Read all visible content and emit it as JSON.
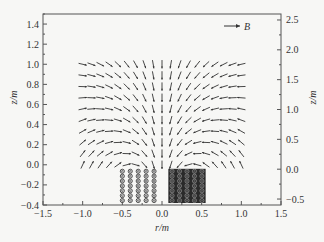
{
  "chart_data": {
    "type": "quiver",
    "title": "",
    "xlabel": "r/m",
    "ylabel_left": "z/m",
    "ylabel_right": "z/m",
    "xlim": [
      -1.5,
      1.5
    ],
    "ylim_left": [
      -0.4,
      1.5
    ],
    "ylim_right": [
      -0.6,
      2.6
    ],
    "x_ticks": [
      "-1.5",
      "-1.0",
      "-0.5",
      "0.0",
      "0.5",
      "1.0",
      "1.5"
    ],
    "y_ticks_left": [
      "-0.4",
      "-0.2",
      "0.0",
      "0.2",
      "0.4",
      "0.6",
      "0.8",
      "1.0",
      "1.2",
      "1.4"
    ],
    "y_ticks_right": [
      "-0.5",
      "0.0",
      "0.5",
      "1.0",
      "1.5",
      "2.0",
      "2.5"
    ],
    "legend": {
      "label": "B",
      "symbol": "arrow"
    },
    "grid": false,
    "field_grid": {
      "r_range": [
        -1.0,
        1.0
      ],
      "z_range": [
        0.0,
        1.0
      ],
      "columns": 19,
      "rows": 10,
      "description": "Magnetic field vectors above coil; vectors point up/inward near axis, fanning outward to the right and down at edges"
    },
    "coils": [
      {
        "name": "left-coil",
        "r_range": [
          -0.55,
          -0.05
        ],
        "z_range": [
          -0.38,
          -0.04
        ],
        "columns": 5,
        "rows": 7,
        "symbol": "dot (current out of page)"
      },
      {
        "name": "right-coil",
        "r_range": [
          0.08,
          0.55
        ],
        "z_range": [
          -0.38,
          -0.04
        ],
        "columns": 5,
        "rows": 7,
        "symbol": "cross (current into page)"
      }
    ]
  }
}
